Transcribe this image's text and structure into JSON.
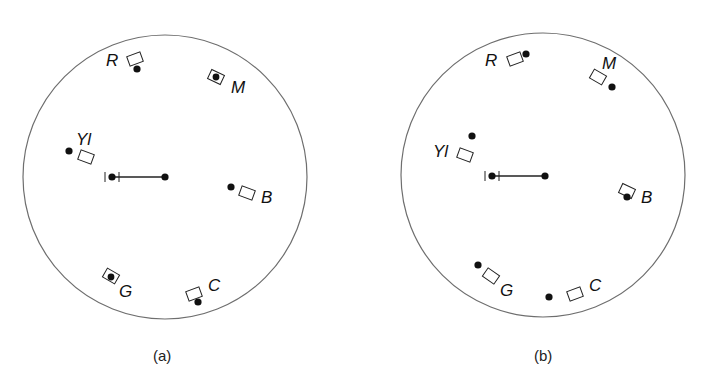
{
  "panels": [
    {
      "caption": "(a)",
      "circle": {
        "cx": 165,
        "cy": 177,
        "r": 142
      },
      "bar": {
        "x1": 112,
        "x2": 165,
        "y": 177
      },
      "markers": [
        {
          "label": "R",
          "label_pos": [
            106,
            66
          ],
          "box": [
            135,
            59,
            -20
          ],
          "dot": [
            137,
            69
          ]
        },
        {
          "label": "M",
          "label_pos": [
            231,
            93
          ],
          "box": [
            216,
            77,
            25
          ],
          "dot": [
            216,
            77
          ]
        },
        {
          "label": "Yl",
          "label_pos": [
            76,
            145
          ],
          "box": [
            86,
            157,
            20
          ],
          "dot": [
            69,
            151
          ]
        },
        {
          "label": "B",
          "label_pos": [
            261,
            203
          ],
          "box": [
            247,
            193,
            20
          ],
          "dot": [
            231,
            187
          ]
        },
        {
          "label": "G",
          "label_pos": [
            119,
            297
          ],
          "box": [
            111,
            276,
            30
          ],
          "dot": [
            111,
            277
          ]
        },
        {
          "label": "C",
          "label_pos": [
            208,
            291
          ],
          "box": [
            194,
            294,
            -20
          ],
          "dot": [
            198,
            302
          ]
        }
      ]
    },
    {
      "caption": "(b)",
      "circle": {
        "cx": 543,
        "cy": 175,
        "r": 142
      },
      "bar": {
        "x1": 492,
        "x2": 545,
        "y": 176
      },
      "markers": [
        {
          "label": "R",
          "label_pos": [
            485,
            66
          ],
          "box": [
            515,
            59,
            -20
          ],
          "dot": [
            526,
            54
          ]
        },
        {
          "label": "M",
          "label_pos": [
            602,
            69
          ],
          "box": [
            598,
            77,
            30
          ],
          "dot": [
            612,
            87
          ]
        },
        {
          "label": "Yl",
          "label_pos": [
            433,
            157
          ],
          "box": [
            465,
            155,
            20
          ],
          "dot": [
            472,
            136
          ]
        },
        {
          "label": "B",
          "label_pos": [
            641,
            203
          ],
          "box": [
            627,
            191,
            25
          ],
          "dot": [
            627,
            197
          ]
        },
        {
          "label": "G",
          "label_pos": [
            500,
            296
          ],
          "box": [
            491,
            276,
            35
          ],
          "dot": [
            478,
            265
          ]
        },
        {
          "label": "C",
          "label_pos": [
            589,
            291
          ],
          "box": [
            575,
            294,
            -20
          ],
          "dot": [
            549,
            297
          ]
        }
      ]
    }
  ],
  "captions": {
    "a": "(a)",
    "b": "(b)"
  }
}
